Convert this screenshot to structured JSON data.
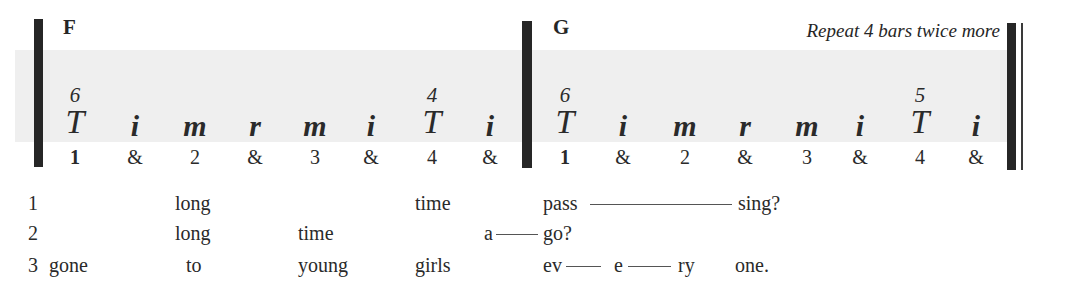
{
  "measures": [
    {
      "chord": "F",
      "strokes": [
        {
          "finger": "6",
          "stroke": "T",
          "beat": "1",
          "x": 75
        },
        {
          "finger": "",
          "stroke": "i",
          "beat": "&",
          "x": 135
        },
        {
          "finger": "",
          "stroke": "m",
          "beat": "2",
          "x": 195
        },
        {
          "finger": "",
          "stroke": "r",
          "beat": "&",
          "x": 255
        },
        {
          "finger": "",
          "stroke": "m",
          "beat": "3",
          "x": 315
        },
        {
          "finger": "",
          "stroke": "i",
          "beat": "&",
          "x": 371
        },
        {
          "finger": "4",
          "stroke": "T",
          "beat": "4",
          "x": 432
        },
        {
          "finger": "",
          "stroke": "i",
          "beat": "&",
          "x": 490
        }
      ]
    },
    {
      "chord": "G",
      "annotation": "Repeat 4 bars twice more",
      "strokes": [
        {
          "finger": "6",
          "stroke": "T",
          "beat": "1",
          "x": 565
        },
        {
          "finger": "",
          "stroke": "i",
          "beat": "&",
          "x": 623
        },
        {
          "finger": "",
          "stroke": "m",
          "beat": "2",
          "x": 685
        },
        {
          "finger": "",
          "stroke": "r",
          "beat": "&",
          "x": 745
        },
        {
          "finger": "",
          "stroke": "m",
          "beat": "3",
          "x": 807
        },
        {
          "finger": "",
          "stroke": "i",
          "beat": "&",
          "x": 860
        },
        {
          "finger": "5",
          "stroke": "T",
          "beat": "4",
          "x": 920
        },
        {
          "finger": "",
          "stroke": "i",
          "beat": "&",
          "x": 976
        }
      ]
    }
  ],
  "lyrics": [
    {
      "verse": "1",
      "words": [
        {
          "text": "long",
          "x": 175
        },
        {
          "text": "time",
          "x": 415
        },
        {
          "text": "pass",
          "x": 543
        },
        {
          "text": "sing?",
          "x": 738
        }
      ],
      "holds": [
        {
          "x1": 590,
          "x2": 732
        }
      ]
    },
    {
      "verse": "2",
      "words": [
        {
          "text": "long",
          "x": 175
        },
        {
          "text": "time",
          "x": 298
        },
        {
          "text": "a",
          "x": 484
        },
        {
          "text": "go?",
          "x": 543
        }
      ],
      "holds": [
        {
          "x1": 496,
          "x2": 538
        }
      ]
    },
    {
      "verse": "3",
      "words": [
        {
          "text": "gone",
          "x": 49
        },
        {
          "text": "to",
          "x": 186
        },
        {
          "text": "young",
          "x": 298
        },
        {
          "text": "girls",
          "x": 415
        },
        {
          "text": "ev",
          "x": 543
        },
        {
          "text": "e",
          "x": 614
        },
        {
          "text": "ry",
          "x": 678
        },
        {
          "text": "one.",
          "x": 735
        }
      ],
      "holds": [
        {
          "x1": 566,
          "x2": 601
        },
        {
          "x1": 628,
          "x2": 671
        }
      ]
    }
  ]
}
